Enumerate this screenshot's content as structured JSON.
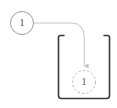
{
  "diagram": {
    "type": "node-drag-into-container",
    "background_color": "#ffffff",
    "source_node": {
      "label": "1",
      "shape": "circle",
      "border_style": "solid",
      "border_color": "#9a9a9a",
      "fill_color": "#ffffff",
      "text_color": "#4a4a4a",
      "center_x": 22,
      "center_y": 23,
      "radius": 12
    },
    "connector": {
      "style": "curved-arrow",
      "color": "#c0c0c0",
      "arrowhead": "triangle",
      "from": "source-node",
      "to": "target-slot"
    },
    "container": {
      "shape": "u-bracket",
      "open_side": "top",
      "border_color": "#3a3a3a",
      "left": 58,
      "top": 34,
      "width": 52,
      "height": 66
    },
    "target_slot": {
      "label": "1",
      "shape": "circle",
      "border_style": "dashed",
      "border_color": "#b0b0b0",
      "fill_color": "#ffffff",
      "text_color": "#555555",
      "center_x": 84,
      "center_y": 82,
      "radius": 12
    }
  }
}
